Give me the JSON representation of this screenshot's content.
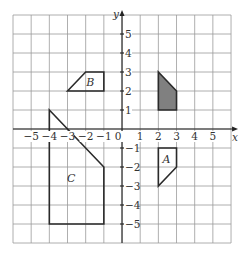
{
  "diagram": {
    "type": "coordinate-grid",
    "grid": {
      "x_min": -6,
      "x_max": 6,
      "y_min": -6,
      "y_max": 6,
      "cell_size_px_x": 18.17,
      "cell_size_px_y": 19
    },
    "axes": {
      "x_label": "x",
      "y_label": "y",
      "x_ticks": [
        "-5",
        "-4",
        "-3",
        "-2",
        "-1",
        "0",
        "1",
        "2",
        "3",
        "4",
        "5"
      ],
      "x_tick_values": [
        -5,
        -4,
        -3,
        -2,
        -1,
        0,
        1,
        2,
        3,
        4,
        5
      ],
      "y_ticks": [
        "5",
        "4",
        "3",
        "2",
        "1",
        "-1",
        "-2",
        "-3",
        "-4",
        "-5"
      ],
      "y_tick_values": [
        5,
        4,
        3,
        2,
        1,
        -1,
        -2,
        -3,
        -4,
        -5
      ]
    },
    "shapes": [
      {
        "name": "shaded",
        "label": "",
        "fill": "#808080",
        "points": [
          [
            2,
            3
          ],
          [
            3,
            2
          ],
          [
            3,
            1
          ],
          [
            2,
            1
          ]
        ]
      },
      {
        "name": "A",
        "label": "A",
        "fill": "none",
        "points": [
          [
            2,
            -1
          ],
          [
            3,
            -1
          ],
          [
            3,
            -2
          ],
          [
            2,
            -3
          ]
        ],
        "label_pos": [
          2.45,
          -1.6
        ]
      },
      {
        "name": "B",
        "label": "B",
        "fill": "none",
        "points": [
          [
            -3,
            2
          ],
          [
            -2,
            3
          ],
          [
            -1,
            3
          ],
          [
            -1,
            2
          ]
        ],
        "label_pos": [
          -1.75,
          2.5
        ]
      },
      {
        "name": "C",
        "label": "C",
        "fill": "none",
        "points": [
          [
            -4,
            1
          ],
          [
            -1,
            -2
          ],
          [
            -1,
            -5
          ],
          [
            -4,
            -5
          ]
        ],
        "label_pos": [
          -2.8,
          -2.6
        ]
      }
    ],
    "colors": {
      "grid": "#9a9a9a",
      "axis": "#222222",
      "outline": "#2a2a2a",
      "text": "#333333"
    }
  }
}
